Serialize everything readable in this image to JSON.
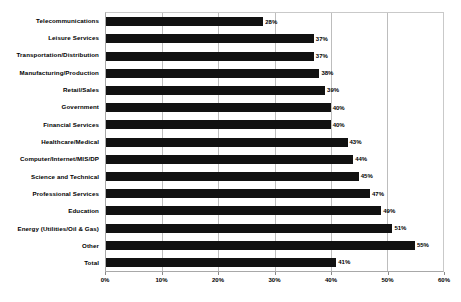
{
  "chart_data": {
    "type": "bar",
    "orientation": "horizontal",
    "title": "",
    "xlabel": "",
    "ylabel": "",
    "xlim": [
      0,
      60
    ],
    "xticks": [
      "0%",
      "10%",
      "20%",
      "30%",
      "40%",
      "50%",
      "60%"
    ],
    "xtick_values": [
      0,
      10,
      20,
      30,
      40,
      50,
      60
    ],
    "grid": true,
    "legend": "none",
    "bar_color": "#111111",
    "categories": [
      "Telecommunications",
      "Leisure Services",
      "Transportation/Distribution",
      "Manufacturing/Production",
      "Retail/Sales",
      "Government",
      "Financial Services",
      "Healthcare/Medical",
      "Computer/Internet/MIS/DP",
      "Science and Technical",
      "Professional Services",
      "Education",
      "Energy (Utilities/Oil & Gas)",
      "Other",
      "Total"
    ],
    "values": [
      28,
      37,
      37,
      38,
      39,
      40,
      40,
      43,
      44,
      45,
      47,
      49,
      51,
      55,
      41
    ],
    "value_labels": [
      "28%",
      "37%",
      "37%",
      "38%",
      "39%",
      "40%",
      "40%",
      "43%",
      "44%",
      "45%",
      "47%",
      "49%",
      "51%",
      "55%",
      "41%"
    ]
  }
}
